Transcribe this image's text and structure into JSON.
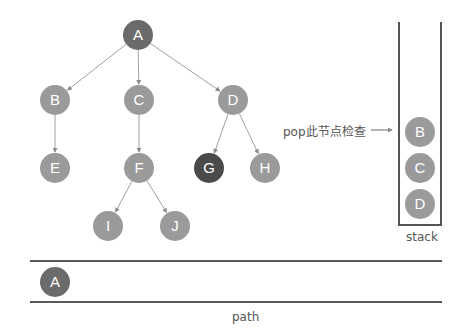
{
  "colors": {
    "visited": "#6b6b6b",
    "current": "#4a4a4a",
    "unvisited": "#9a9a9a",
    "edge": "#a0a0a0"
  },
  "tree": {
    "nodes": [
      {
        "id": "A",
        "label": "A",
        "x": 138,
        "y": 35,
        "state": "visited"
      },
      {
        "id": "B",
        "label": "B",
        "x": 55,
        "y": 100,
        "state": "unvisited"
      },
      {
        "id": "C",
        "label": "C",
        "x": 139,
        "y": 100,
        "state": "unvisited"
      },
      {
        "id": "D",
        "label": "D",
        "x": 233,
        "y": 100,
        "state": "unvisited"
      },
      {
        "id": "E",
        "label": "E",
        "x": 55,
        "y": 168,
        "state": "unvisited"
      },
      {
        "id": "F",
        "label": "F",
        "x": 139,
        "y": 168,
        "state": "unvisited"
      },
      {
        "id": "G",
        "label": "G",
        "x": 209,
        "y": 168,
        "state": "current"
      },
      {
        "id": "H",
        "label": "H",
        "x": 265,
        "y": 168,
        "state": "unvisited"
      },
      {
        "id": "I",
        "label": "I",
        "x": 108,
        "y": 226,
        "state": "unvisited"
      },
      {
        "id": "J",
        "label": "J",
        "x": 175,
        "y": 226,
        "state": "unvisited"
      }
    ],
    "edges": [
      [
        "A",
        "B"
      ],
      [
        "A",
        "C"
      ],
      [
        "A",
        "D"
      ],
      [
        "B",
        "E"
      ],
      [
        "C",
        "F"
      ],
      [
        "D",
        "G"
      ],
      [
        "D",
        "H"
      ],
      [
        "F",
        "I"
      ],
      [
        "F",
        "J"
      ]
    ]
  },
  "annotation": {
    "text": "pop此节点检查"
  },
  "stack": {
    "label": "stack",
    "items": [
      {
        "label": "B"
      },
      {
        "label": "C"
      },
      {
        "label": "D"
      }
    ]
  },
  "path": {
    "label": "path",
    "items": [
      {
        "label": "A"
      }
    ]
  }
}
